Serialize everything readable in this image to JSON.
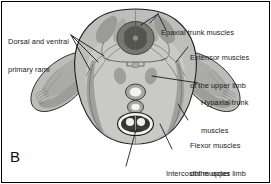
{
  "figure": {
    "panel_letter": "B",
    "caption_labels": [
      {
        "id": "dorsal-ventral-primary-rami",
        "lines": [
          "Dorsal and ventral",
          "primary rami"
        ],
        "x": 8,
        "y": 19,
        "side": "left"
      },
      {
        "id": "epaxial-trunk-muscles",
        "lines": [
          "Epaxial trunk muscles"
        ],
        "x": 161,
        "y": 10,
        "side": "right"
      },
      {
        "id": "extensor-muscles-upper-limb",
        "lines": [
          "Extensor muscles",
          "of the upper limb"
        ],
        "x": 190,
        "y": 35,
        "side": "right"
      },
      {
        "id": "hypaxial-trunk-muscles",
        "lines": [
          "Hypaxial trunk",
          "muscles"
        ],
        "x": 201,
        "y": 80,
        "side": "right"
      },
      {
        "id": "flexor-muscles-upper-limb",
        "lines": [
          "Flexor muscles",
          "of the upper limb"
        ],
        "x": 190,
        "y": 123,
        "side": "right"
      },
      {
        "id": "intercostal-muscles",
        "lines": [
          "Intercostal muscles"
        ],
        "x": 166,
        "y": 151,
        "side": "right"
      },
      {
        "id": "heart",
        "lines": [
          "Heart"
        ],
        "x": 123,
        "y": 168,
        "side": "bottom"
      }
    ],
    "colors": {
      "body_fill": "#b9bab6",
      "body_fill_light": "#c9cac6",
      "inner_fill": "#cfd0cb",
      "muscle_dark": "#8e8f8a",
      "muscle_mid": "#a1a29d",
      "cord_dark": "#6e6f6b",
      "cord_gray_matter": "#5a5b57",
      "heart_dark": "#3a3b38",
      "vessel_white": "#f2f2f0",
      "outline": "#1c1c1c",
      "leader": "#111111",
      "text": "#1a1a1a",
      "background": "#ffffff"
    },
    "anatomy_regions": [
      "neural tube / spinal cord",
      "epaxial trunk muscle mass",
      "hypaxial trunk muscle mass",
      "upper limb bud with extensor and flexor muscle masses",
      "intercostal muscles",
      "dorsal and ventral primary rami",
      "heart",
      "dorsal aorta",
      "gut tube"
    ]
  }
}
